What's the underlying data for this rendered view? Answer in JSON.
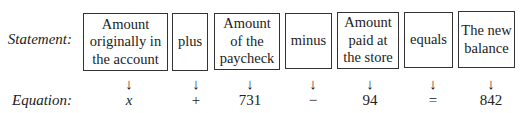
{
  "labels": {
    "statement": "Statement:",
    "equation": "Equation:"
  },
  "statement": [
    {
      "text": "Amount originally in the account"
    },
    {
      "text": "plus"
    },
    {
      "text": "Amount of the paycheck"
    },
    {
      "text": "minus"
    },
    {
      "text": "Amount paid at the store"
    },
    {
      "text": "equals"
    },
    {
      "text": "The new balance"
    }
  ],
  "arrow": "↓",
  "equation": [
    "x",
    "+",
    "731",
    "−",
    "94",
    "=",
    "842"
  ]
}
